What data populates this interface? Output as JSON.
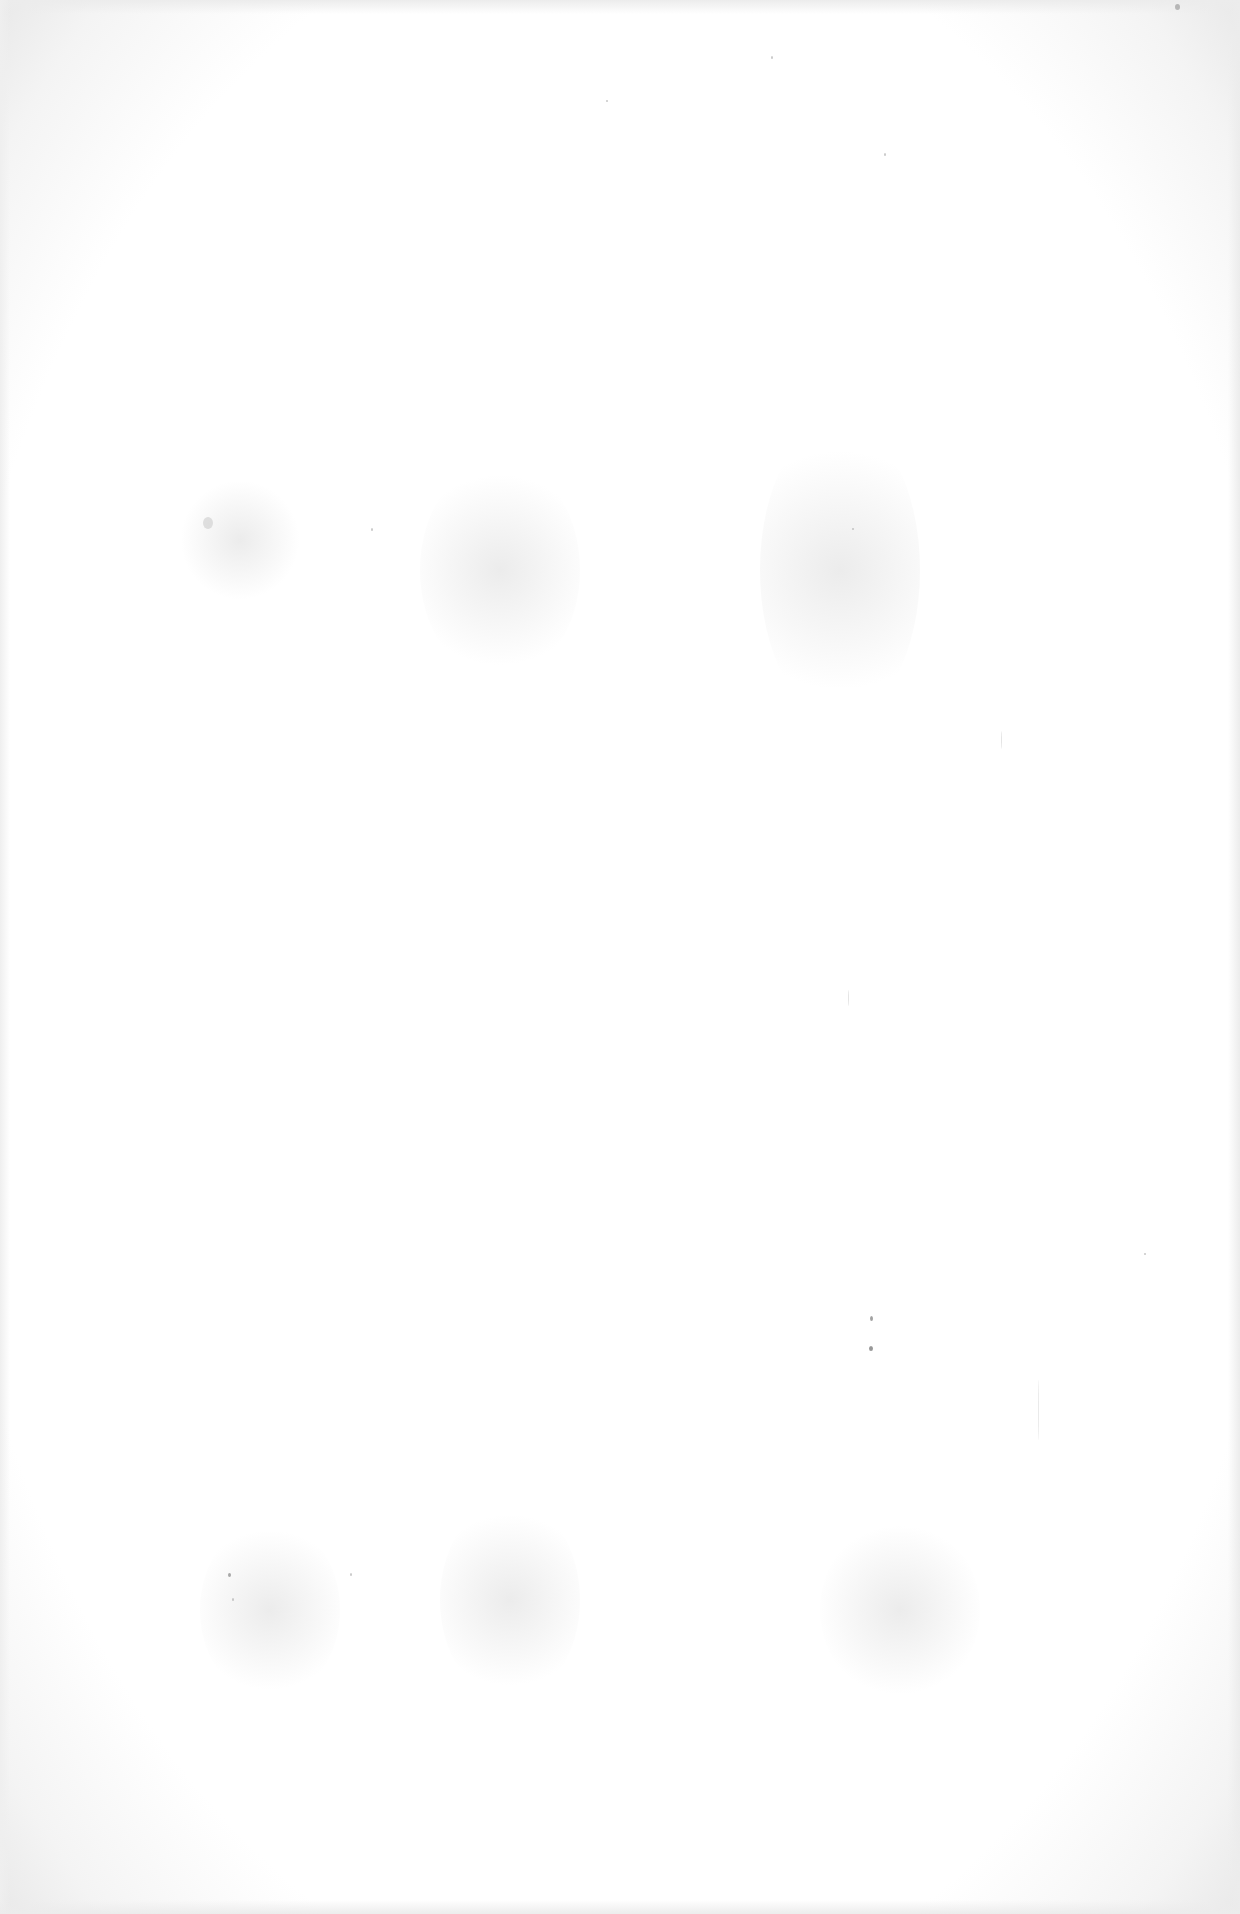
{
  "page": {
    "type": "blank-scanned-page",
    "background_color": "#ffffff",
    "edge_shade_color": "#e9e9e9",
    "text_content": []
  }
}
